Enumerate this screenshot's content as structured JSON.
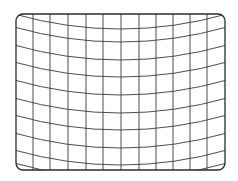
{
  "diagram": {
    "title": "",
    "type": "distorted-grid",
    "frame": {
      "x": 16,
      "y": 14,
      "width": 209,
      "height": 156,
      "corner_radius": 7
    },
    "vertical_lines_x": [
      33,
      50,
      68,
      86,
      103,
      121,
      139,
      156,
      173,
      190,
      207
    ],
    "horizontal_curves_edge_y": [
      14,
      27,
      45,
      62,
      80,
      98,
      115,
      133,
      150,
      163
    ],
    "curve_sag_px": 15,
    "colors": {
      "line": "#3a3a3a",
      "frame": "#2a2a2a",
      "background": "#ffffff"
    }
  }
}
